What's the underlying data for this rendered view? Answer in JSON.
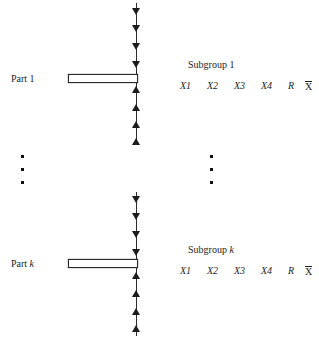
{
  "diagram": {
    "rows": [
      {
        "part_label_prefix": "Part ",
        "part_label_index": "1",
        "part_index_italic": false,
        "subgroup_label_prefix": "Subgroup ",
        "subgroup_label_index": "1",
        "subgroup_index_italic": false,
        "columns": [
          "X1",
          "X2",
          "X3",
          "X4",
          "R",
          "X"
        ],
        "range_label": "R",
        "mean_label": "X"
      },
      {
        "part_label_prefix": "Part ",
        "part_label_index": "k",
        "part_index_italic": true,
        "subgroup_label_prefix": "Subgroup ",
        "subgroup_label_index": "k",
        "subgroup_index_italic": true,
        "columns": [
          "X1",
          "X2",
          "X3",
          "X4",
          "R",
          "X"
        ],
        "range_label": "R",
        "mean_label": "X"
      }
    ],
    "ellipsis": {
      "left_dots": 3,
      "right_dots": 3
    },
    "arrows": {
      "down_count_per_row": 4,
      "up_count_per_row": 4,
      "down_direction": "down",
      "up_direction": "up"
    },
    "colors": {
      "line": "#2b2b2b",
      "arrow": "#1c1c1c",
      "text": "#1d1d1d",
      "bar_border": "#2a2a2a",
      "background": "#ffffff"
    }
  }
}
